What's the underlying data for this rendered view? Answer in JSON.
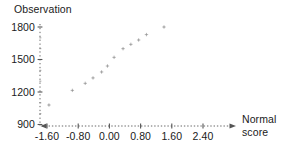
{
  "chart_data": {
    "type": "scatter",
    "title": "",
    "ylabel": "Observation",
    "xlabel": "Normal score",
    "xlabel_lines": [
      "Normal",
      "score"
    ],
    "x": [
      -1.55,
      -0.95,
      -0.62,
      -0.42,
      -0.2,
      -0.05,
      0.12,
      0.35,
      0.55,
      0.75,
      0.95,
      1.4
    ],
    "y": [
      1080,
      1215,
      1280,
      1330,
      1385,
      1440,
      1520,
      1600,
      1640,
      1680,
      1730,
      1800
    ],
    "points": [
      {
        "x": -1.55,
        "y": 1080
      },
      {
        "x": -0.95,
        "y": 1215
      },
      {
        "x": -0.62,
        "y": 1280
      },
      {
        "x": -0.42,
        "y": 1330
      },
      {
        "x": -0.2,
        "y": 1385
      },
      {
        "x": -0.05,
        "y": 1440
      },
      {
        "x": 0.12,
        "y": 1520
      },
      {
        "x": 0.35,
        "y": 1600
      },
      {
        "x": 0.55,
        "y": 1640
      },
      {
        "x": 0.75,
        "y": 1680
      },
      {
        "x": 0.95,
        "y": 1730
      },
      {
        "x": 1.4,
        "y": 1800
      }
    ],
    "xlim": [
      -1.95,
      2.75
    ],
    "ylim": [
      870,
      1860
    ],
    "xticks": [
      -1.6,
      -0.8,
      0.0,
      0.8,
      1.6,
      2.4
    ],
    "xticklabels": [
      "-1.60",
      "-0.80",
      "0.00",
      "0.80",
      "1.60",
      "2.40"
    ],
    "yticks": [
      900,
      1200,
      1500,
      1800
    ],
    "yticklabels": [
      "900",
      "1200",
      "1500",
      "1800"
    ],
    "y_minor_ticks": [
      1000,
      1100,
      1300,
      1400,
      1600,
      1700
    ],
    "grid": false,
    "legend": null,
    "marker_color": "#b4b4b4",
    "axis_color": "#555555",
    "text_color": "#1a1a1a"
  }
}
